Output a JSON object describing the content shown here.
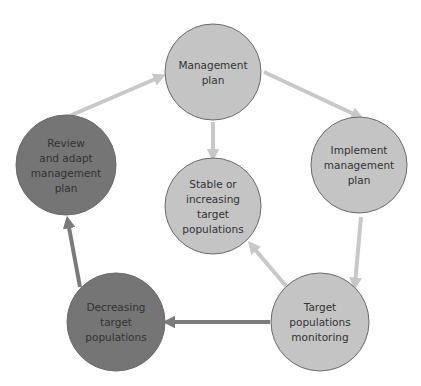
{
  "diagram": {
    "type": "cycle",
    "colors": {
      "light_node": "#c4c4c4",
      "dark_node": "#757575",
      "node_border": "#6a6a6a",
      "light_arrow": "#c8c8c8",
      "dark_arrow": "#7a7a7a",
      "text": "#333333"
    },
    "nodes": [
      {
        "id": "management-plan",
        "lines": [
          "Management",
          "plan"
        ],
        "cx": 213,
        "cy": 72,
        "r": 48,
        "tone": "light"
      },
      {
        "id": "implement-management-plan",
        "lines": [
          "Implement",
          "management",
          "plan"
        ],
        "cx": 359,
        "cy": 165,
        "r": 48,
        "tone": "light"
      },
      {
        "id": "stable-or-increasing",
        "lines": [
          "Stable or",
          "increasing",
          "target",
          "populations"
        ],
        "cx": 213,
        "cy": 206,
        "r": 48,
        "tone": "light"
      },
      {
        "id": "target-populations-monitoring",
        "lines": [
          "Target",
          "populations",
          "monitoring"
        ],
        "cx": 320,
        "cy": 322,
        "r": 49,
        "tone": "light"
      },
      {
        "id": "decreasing-target-populations",
        "lines": [
          "Decreasing",
          "target",
          "populations"
        ],
        "cx": 116,
        "cy": 322,
        "r": 49,
        "tone": "dark"
      },
      {
        "id": "review-and-adapt",
        "lines": [
          "Review",
          "and adapt",
          "management",
          "plan"
        ],
        "cx": 66,
        "cy": 165,
        "r": 50,
        "tone": "dark"
      }
    ],
    "edges": [
      {
        "from": "management-plan",
        "to": "implement-management-plan",
        "x1": 264,
        "y1": 72,
        "x2": 358,
        "y2": 116,
        "tone": "light"
      },
      {
        "from": "implement-management-plan",
        "to": "target-populations-monitoring",
        "x1": 361,
        "y1": 217,
        "x2": 355,
        "y2": 284,
        "tone": "light"
      },
      {
        "from": "target-populations-monitoring",
        "to": "stable-or-increasing",
        "x1": 286,
        "y1": 286,
        "x2": 252,
        "y2": 246,
        "tone": "light"
      },
      {
        "from": "target-populations-monitoring",
        "to": "decreasing-target-populations",
        "x1": 270,
        "y1": 322,
        "x2": 169,
        "y2": 322,
        "tone": "dark"
      },
      {
        "from": "decreasing-target-populations",
        "to": "review-and-adapt",
        "x1": 80,
        "y1": 287,
        "x2": 68,
        "y2": 222,
        "tone": "dark"
      },
      {
        "from": "review-and-adapt",
        "to": "management-plan",
        "x1": 67,
        "y1": 117,
        "x2": 160,
        "y2": 77,
        "tone": "light"
      },
      {
        "from": "management-plan",
        "to": "stable-or-increasing",
        "x1": 213,
        "y1": 122,
        "x2": 213,
        "y2": 155,
        "tone": "light"
      }
    ]
  }
}
